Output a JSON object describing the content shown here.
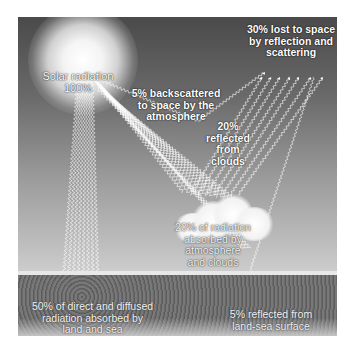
{
  "diagram": {
    "sun": {
      "label_line1": "Solar radiation",
      "label_line2": "100%"
    },
    "labels": {
      "backscattered": {
        "line1": "5% backscattered",
        "line2": "to space by the",
        "line3": "atmosphere"
      },
      "lost_to_space": {
        "line1": "30% lost to space",
        "line2": "by reflection and",
        "line3": "scattering"
      },
      "reflected_clouds": {
        "line1": "20%",
        "line2": "reflected",
        "line3": "from",
        "line4": "clouds"
      },
      "absorbed_atmosphere": {
        "line1": "20% of radiation",
        "line2": "absorbed by",
        "line3": "atmosphere",
        "line4": "and clouds"
      },
      "absorbed_land": {
        "line1": "50% of direct and diffused",
        "line2": "radiation absorbed by",
        "line3": "land and sea"
      },
      "reflected_surface": {
        "line1": "5% reflected from",
        "line2": "land-sea surface"
      }
    },
    "colors": {
      "sky_top": "#4a4a4a",
      "sky_bottom": "#d8d8d8",
      "ray": "#ffffff",
      "ground": "#a8a8a8"
    }
  }
}
